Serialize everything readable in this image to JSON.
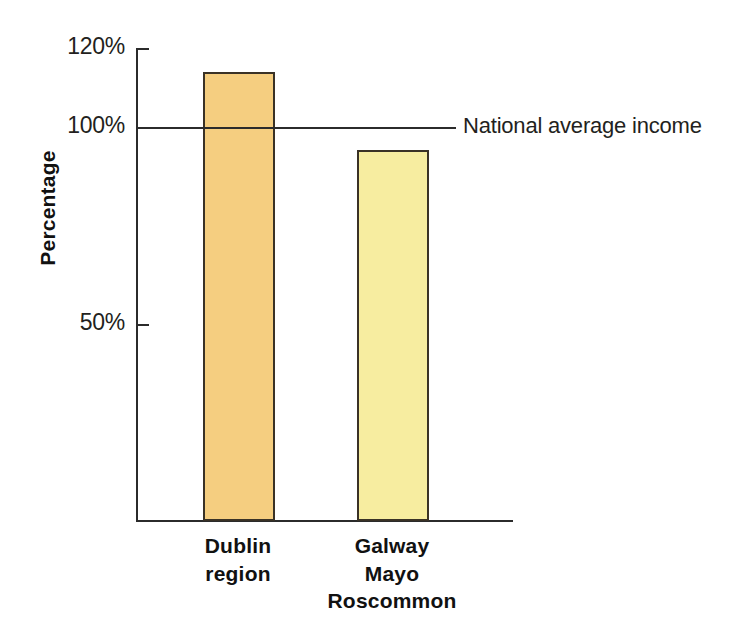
{
  "chart_data": {
    "type": "bar",
    "title": "",
    "xlabel": "",
    "ylabel": "Percentage",
    "categories": [
      "Dublin region",
      "Galway Mayo Roscommon"
    ],
    "category_lines": [
      [
        "Dublin",
        "region"
      ],
      [
        "Galway",
        "Mayo",
        "Roscommon"
      ]
    ],
    "values": [
      114,
      94
    ],
    "value_unit": "%",
    "ylim": [
      0,
      120
    ],
    "yticks": [
      50,
      100,
      120
    ],
    "ytick_labels": [
      "50%",
      "100%",
      "120%"
    ],
    "grid": false,
    "legend": false,
    "bar_colors": [
      "#f5ce80",
      "#f7eda0"
    ],
    "bar_border_color": "#3a3226",
    "annotations": [
      {
        "name": "national-average-reference-line",
        "label": "National average income",
        "value": 100,
        "orientation": "horizontal",
        "color": "#2b2b2b"
      }
    ]
  },
  "axes": {
    "y_title": "Percentage",
    "ticks": [
      {
        "label": "120%",
        "value": 120
      },
      {
        "label": "100%",
        "value": 100
      },
      {
        "label": "50%",
        "value": 50
      }
    ],
    "axis_color": "#2b2b2b"
  },
  "annotation": {
    "national_average_label": "National average income"
  },
  "bars": [
    {
      "name": "dublin-region",
      "value": 114,
      "color": "#f5ce80",
      "label_lines": [
        "Dublin",
        "region"
      ]
    },
    {
      "name": "galway-mayo-roscommon",
      "value": 94,
      "color": "#f7eda0",
      "label_lines": [
        "Galway",
        "Mayo",
        "Roscommon"
      ]
    }
  ],
  "labels": {
    "dublin_line1": "Dublin",
    "dublin_line2": "region",
    "gmr_line1": "Galway",
    "gmr_line2": "Mayo",
    "gmr_line3": "Roscommon"
  }
}
